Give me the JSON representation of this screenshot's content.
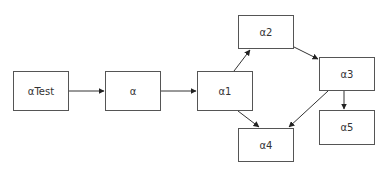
{
  "diagram": {
    "type": "flowchart",
    "nodes": [
      {
        "id": "aTest",
        "label": "αTest"
      },
      {
        "id": "a",
        "label": "α"
      },
      {
        "id": "a1",
        "label": "α1"
      },
      {
        "id": "a2",
        "label": "α2"
      },
      {
        "id": "a3",
        "label": "α3"
      },
      {
        "id": "a4",
        "label": "α4"
      },
      {
        "id": "a5",
        "label": "α5"
      }
    ],
    "edges": [
      {
        "from": "αTest",
        "to": "α"
      },
      {
        "from": "α",
        "to": "α1"
      },
      {
        "from": "α1",
        "to": "α2"
      },
      {
        "from": "α1",
        "to": "α4"
      },
      {
        "from": "α2",
        "to": "α3"
      },
      {
        "from": "α3",
        "to": "α4"
      },
      {
        "from": "α3",
        "to": "α5"
      }
    ],
    "colors": {
      "stroke": "#555555",
      "text": "#333333",
      "background": "#ffffff"
    }
  }
}
